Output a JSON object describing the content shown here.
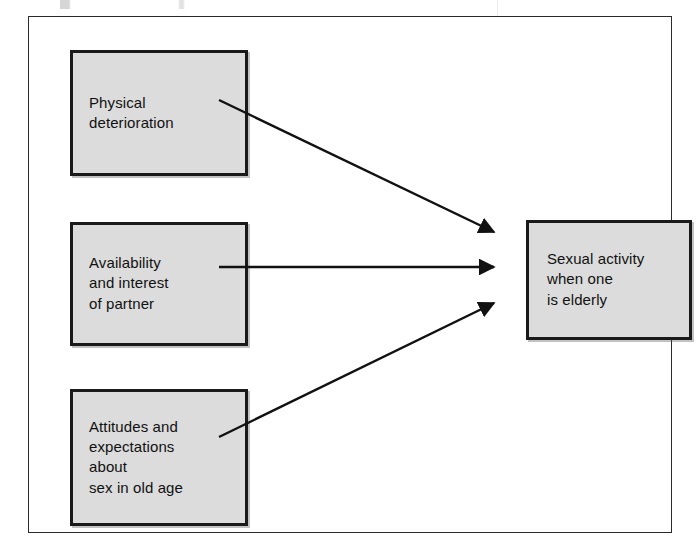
{
  "figure": {
    "type": "concept-diagram",
    "boxes": [
      {
        "id": "physical",
        "label": "Physical\ndeterioration",
        "role": "antecedent"
      },
      {
        "id": "availability",
        "label": "Availability\nand interest\nof partner",
        "role": "antecedent"
      },
      {
        "id": "attitudes",
        "label": "Attitudes and\nexpectations\nabout\nsex in old age",
        "role": "antecedent"
      },
      {
        "id": "outcome",
        "label": "Sexual activity\nwhen one\nis elderly",
        "role": "outcome"
      }
    ],
    "arrows": [
      {
        "id": "arrow-physical-to-outcome",
        "from": "physical",
        "to": "outcome",
        "direction": "down-right"
      },
      {
        "id": "arrow-availability-to-outcome",
        "from": "availability",
        "to": "outcome",
        "direction": "horizontal"
      },
      {
        "id": "arrow-attitudes-to-outcome",
        "from": "attitudes",
        "to": "outcome",
        "direction": "up-right"
      }
    ],
    "colors": {
      "box_fill": "#dcdcdc",
      "box_border": "#1a1a1a",
      "frame_border": "#2b2b2b",
      "arrow": "#111111",
      "text": "#111111",
      "background": "#ffffff"
    }
  }
}
